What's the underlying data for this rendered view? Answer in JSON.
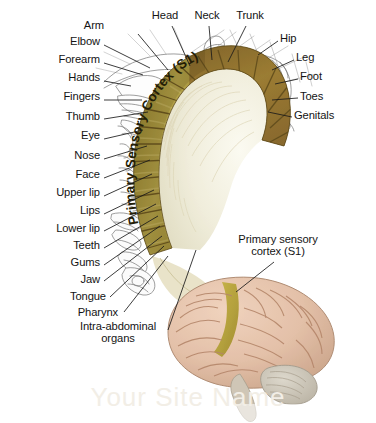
{
  "figure": {
    "background_color": "#ffffff",
    "band_color": "#9a8a33",
    "band_dark_color": "#8a6a2e",
    "white_matter_color": "#f3f1e1",
    "brain_color": "#e5c3ac",
    "brain_strip_color": "#b6a33a",
    "cerebellum_color": "#cdc7bb",
    "label_color": "#141414",
    "leader_color": "#1a1a1a"
  },
  "band_caption": "Primary Sensory Cortex (S1)",
  "labels_left": [
    {
      "text": "Elbow",
      "x": 100,
      "y": 41,
      "lx": 104,
      "ly": 45,
      "tx": 150,
      "ty": 68
    },
    {
      "text": "Forearm",
      "x": 100,
      "y": 59,
      "lx": 104,
      "ly": 63,
      "tx": 143,
      "ty": 75
    },
    {
      "text": "Hands",
      "x": 100,
      "y": 77,
      "lx": 104,
      "ly": 81,
      "tx": 131,
      "ty": 86
    },
    {
      "text": "Fingers",
      "x": 100,
      "y": 96,
      "lx": 104,
      "ly": 100,
      "tx": 142,
      "ty": 100
    },
    {
      "text": "Thumb",
      "x": 100,
      "y": 116,
      "lx": 104,
      "ly": 119,
      "tx": 148,
      "ty": 112
    },
    {
      "text": "Eye",
      "x": 100,
      "y": 135,
      "lx": 104,
      "ly": 139,
      "tx": 143,
      "ty": 130
    },
    {
      "text": "Nose",
      "x": 100,
      "y": 155,
      "lx": 104,
      "ly": 159,
      "tx": 147,
      "ty": 146
    },
    {
      "text": "Face",
      "x": 100,
      "y": 174,
      "lx": 104,
      "ly": 178,
      "tx": 150,
      "ty": 160
    },
    {
      "text": "Upper lip",
      "x": 100,
      "y": 192,
      "lx": 104,
      "ly": 196,
      "tx": 152,
      "ty": 174
    },
    {
      "text": "Lips",
      "x": 100,
      "y": 210,
      "lx": 104,
      "ly": 214,
      "tx": 154,
      "ty": 190
    },
    {
      "text": "Lower lip",
      "x": 100,
      "y": 228,
      "lx": 104,
      "ly": 231,
      "tx": 156,
      "ty": 204
    },
    {
      "text": "Teeth",
      "x": 100,
      "y": 245,
      "lx": 104,
      "ly": 248,
      "tx": 158,
      "ty": 216
    },
    {
      "text": "Gums",
      "x": 100,
      "y": 262,
      "lx": 104,
      "ly": 265,
      "tx": 160,
      "ty": 226
    },
    {
      "text": "Jaw",
      "x": 100,
      "y": 279,
      "lx": 104,
      "ly": 281,
      "tx": 162,
      "ty": 236
    },
    {
      "text": "Tongue",
      "x": 106,
      "y": 296,
      "lx": 110,
      "ly": 297,
      "tx": 164,
      "ty": 246
    },
    {
      "text": "Pharynx",
      "x": 118,
      "y": 312,
      "lx": 124,
      "ly": 312,
      "tx": 168,
      "ty": 256
    }
  ],
  "label_intra": {
    "line1": "Intra-abdominal",
    "line2": "organs",
    "x": 68,
    "y": 326,
    "tx": 196,
    "ty": 250
  },
  "labels_top": [
    {
      "text": "Arm",
      "x": 104,
      "y": 25,
      "anchor": "end",
      "lx": 138,
      "ly": 34,
      "tx": 168,
      "ty": 70
    },
    {
      "text": "Head",
      "x": 165,
      "y": 15,
      "anchor": "middle",
      "lx": 172,
      "ly": 26,
      "tx": 190,
      "ty": 66
    },
    {
      "text": "Neck",
      "x": 207,
      "y": 15,
      "anchor": "middle",
      "lx": 209,
      "ly": 26,
      "tx": 212,
      "ty": 60
    },
    {
      "text": "Trunk",
      "x": 250,
      "y": 15,
      "anchor": "middle",
      "lx": 246,
      "ly": 26,
      "tx": 228,
      "ty": 62
    }
  ],
  "labels_right": [
    {
      "text": "Hip",
      "x": 280,
      "y": 38,
      "lx": 278,
      "ly": 41,
      "tx": 258,
      "ty": 55
    },
    {
      "text": "Leg",
      "x": 296,
      "y": 57,
      "lx": 294,
      "ly": 60,
      "tx": 272,
      "ty": 70
    },
    {
      "text": "Foot",
      "x": 300,
      "y": 76,
      "lx": 298,
      "ly": 79,
      "tx": 275,
      "ty": 84
    },
    {
      "text": "Toes",
      "x": 300,
      "y": 96,
      "lx": 298,
      "ly": 98,
      "tx": 272,
      "ty": 100
    },
    {
      "text": "Genitals",
      "x": 294,
      "y": 115,
      "lx": 292,
      "ly": 117,
      "tx": 268,
      "ty": 112
    }
  ],
  "callout_brain": {
    "line1": "Primary sensory",
    "line2": "cortex (S1)",
    "x": 278,
    "y": 239,
    "lx": 274,
    "ly": 262,
    "tx": 236,
    "ty": 292
  },
  "watermark": "Your Site Name"
}
